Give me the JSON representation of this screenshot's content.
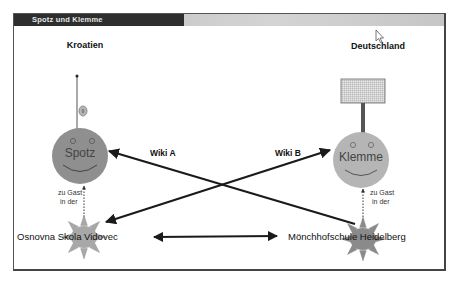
{
  "window": {
    "title": "Spotz und Klemme"
  },
  "countries": {
    "left": "Kroatien",
    "right": "Deutschland"
  },
  "characters": {
    "left": {
      "name": "Spotz",
      "accessory": "antenna"
    },
    "right": {
      "name": "Klemme",
      "accessory": "sign-board"
    }
  },
  "links": {
    "wiki_a": "Wiki A",
    "wiki_b": "Wiki B"
  },
  "guest": {
    "left_line1": "zu Gast",
    "left_line2": "in der",
    "right_line1": "zu Gast",
    "right_line2": "in der"
  },
  "schools": {
    "left": "Osnovna Skola Vidovec",
    "right": "Mönchhofschule Heidelberg"
  },
  "cursor": {
    "type": "arrow-cursor"
  },
  "colors": {
    "spotz_fill": "#8f8f8f",
    "klemme_fill": "#b5b5b5",
    "sun_left_fill": "#a8a8a8",
    "sun_right_fill": "#8a8a8a",
    "arrow": "#1a1a1a"
  }
}
